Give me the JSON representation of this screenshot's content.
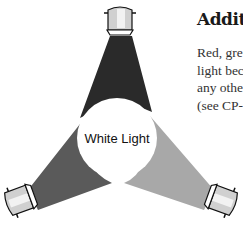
{
  "document": {
    "title": "Addit",
    "body_lines": [
      "Red, gre",
      "light bec",
      "any othe",
      "(see CP-3"
    ]
  },
  "figure": {
    "center_label": "White Light",
    "lamps": [
      {
        "name": "top-lamp",
        "beam_color": "#2a2a2a"
      },
      {
        "name": "left-lamp",
        "beam_color": "#5a5a5a"
      },
      {
        "name": "right-lamp",
        "beam_color": "#a8a8a8"
      }
    ],
    "colors": {
      "lamp_body": "#d0d0d0",
      "lamp_highlight": "#f2f2f2",
      "outline": "#111111",
      "circle": "#ffffff"
    }
  }
}
